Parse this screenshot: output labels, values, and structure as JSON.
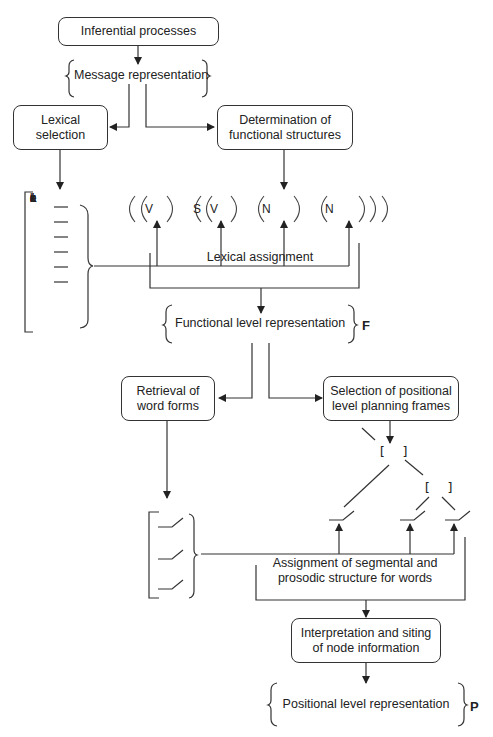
{
  "diagram": {
    "boxes": {
      "inferential": "Inferential processes",
      "lexical_selection_1": "Lexical",
      "lexical_selection_2": "selection",
      "determination_1": "Determination of",
      "determination_2": "functional structures",
      "retrieval_1": "Retrieval of",
      "retrieval_2": "word forms",
      "selection_frames_1": "Selection of positional",
      "selection_frames_2": "level planning frames",
      "interpretation_1": "Interpretation and siting",
      "interpretation_2": "of node information"
    },
    "representations": {
      "message": "Message representation",
      "functional": "Functional level representation",
      "positional": "Positional level representation"
    },
    "level_tags": {
      "functional": "F",
      "positional": "P"
    },
    "processes": {
      "lexical_assignment": "Lexical assignment",
      "segmental_1": "Assignment of segmental and",
      "segmental_2": "prosodic structure for words"
    },
    "lexical_set": {
      "letters": [
        "L",
        "e",
        "x",
        "i",
        "c",
        "a",
        "l",
        "",
        "s",
        "e",
        "t"
      ]
    },
    "functional_frame": {
      "slots": [
        "V",
        "S",
        "V",
        "N",
        "N"
      ]
    }
  }
}
